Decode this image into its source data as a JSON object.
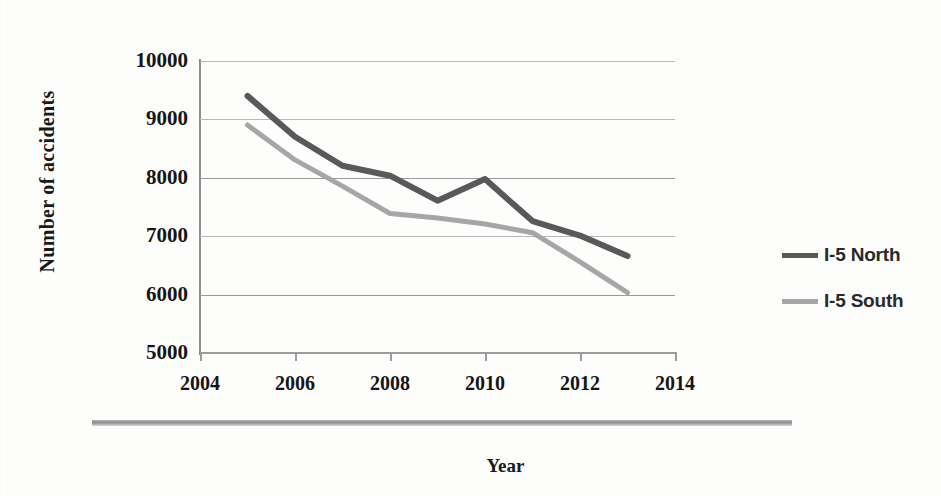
{
  "chart_data": {
    "type": "line",
    "title": "",
    "xlabel": "Year",
    "ylabel": "Number of accidents",
    "x": [
      2005,
      2006,
      2007,
      2008,
      2009,
      2010,
      2011,
      2012,
      2013
    ],
    "xlim": [
      2004,
      2014
    ],
    "ylim": [
      5000,
      10000
    ],
    "xticks": [
      "2004",
      "2006",
      "2008",
      "2010",
      "2012",
      "2014"
    ],
    "yticks": [
      "5000",
      "6000",
      "7000",
      "8000",
      "9000",
      "10000"
    ],
    "grid": "horizontal",
    "legend_position": "right",
    "series": [
      {
        "name": "I-5 North",
        "color": "#595959",
        "values": [
          9400,
          8700,
          8200,
          8030,
          7600,
          7970,
          7250,
          7000,
          6650
        ]
      },
      {
        "name": "I-5 South",
        "color": "#a6a6a6",
        "values": [
          8900,
          8300,
          7850,
          7380,
          7300,
          7200,
          7050,
          6550,
          6020
        ]
      }
    ]
  },
  "axes": {
    "y_title": "Number of accidents",
    "x_title": "Year",
    "y_tick_labels": [
      "10000",
      "9000",
      "8000",
      "7000",
      "6000",
      "5000"
    ],
    "x_tick_labels": [
      "2004",
      "2006",
      "2008",
      "2010",
      "2012",
      "2014"
    ]
  },
  "legend": {
    "items": [
      {
        "label": "I-5 North",
        "color": "#595959"
      },
      {
        "label": "I-5 South",
        "color": "#a6a6a6"
      }
    ]
  },
  "colors": {
    "series_north": "#595959",
    "series_south": "#a6a6a6",
    "gridline": "#9a9a9a",
    "axis": "#8c8c8c",
    "text": "#151515",
    "background": "#fdfdfc"
  }
}
